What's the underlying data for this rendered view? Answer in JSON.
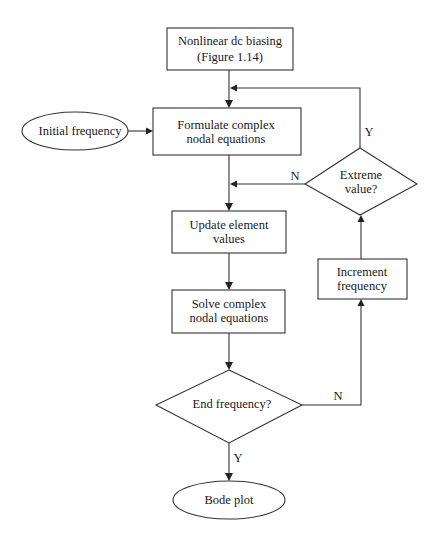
{
  "diagram": {
    "type": "flowchart",
    "nodes": {
      "dc_biasing": {
        "line1": "Nonlinear dc biasing",
        "line2": "(Figure 1.14)"
      },
      "initial_frequency": {
        "label": "Initial frequency"
      },
      "formulate": {
        "line1": "Formulate complex",
        "line2": "nodal equations"
      },
      "extreme_value": {
        "line1": "Extreme",
        "line2": "value?"
      },
      "update": {
        "line1": "Update element",
        "line2": "values"
      },
      "solve": {
        "line1": "Solve complex",
        "line2": "nodal equations"
      },
      "increment": {
        "line1": "Increment",
        "line2": "frequency"
      },
      "end_frequency": {
        "label": "End frequency?"
      },
      "bode_plot": {
        "label": "Bode plot"
      }
    },
    "edge_labels": {
      "extreme_yes": "Y",
      "extreme_no": "N",
      "end_no": "N",
      "end_yes": "Y"
    }
  }
}
